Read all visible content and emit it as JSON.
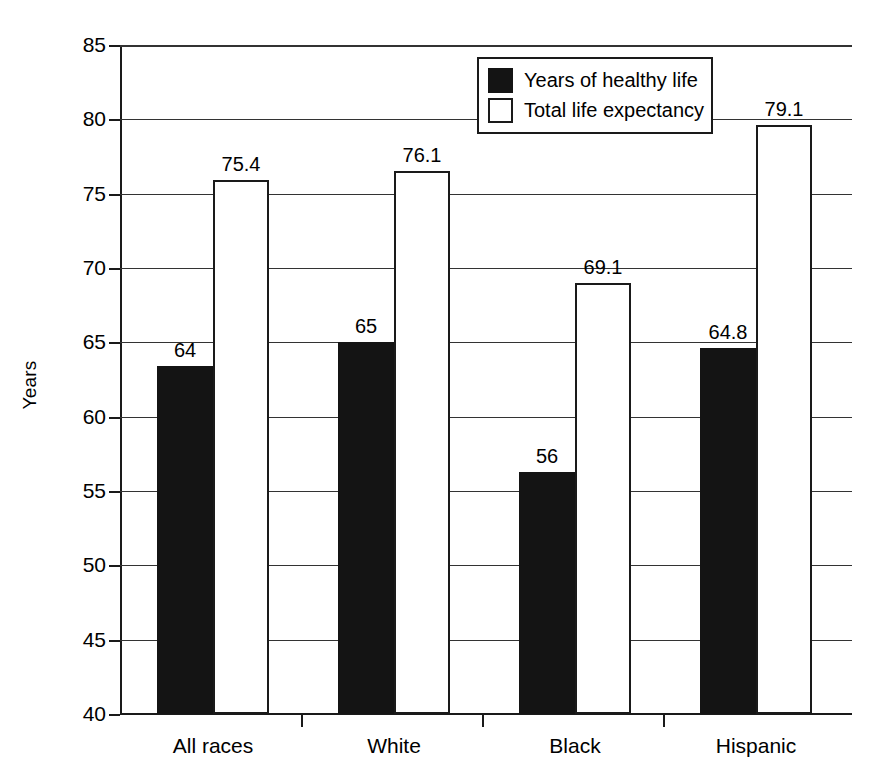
{
  "chart_data": {
    "type": "bar",
    "title": "",
    "subtitle": "",
    "xlabel": "",
    "ylabel": "Years",
    "ylim": [
      40,
      85
    ],
    "yticks": [
      40,
      45,
      50,
      55,
      60,
      65,
      70,
      75,
      80,
      85
    ],
    "grid": true,
    "legend_position": "top-center",
    "categories": [
      "All races",
      "White",
      "Black",
      "Hispanic"
    ],
    "series": [
      {
        "name": "Years of healthy life",
        "color": "#141414",
        "values": [
          63.4,
          65.0,
          56.3,
          64.6
        ],
        "labels": [
          "64",
          "65",
          "56",
          "64.8"
        ]
      },
      {
        "name": "Total life expectancy",
        "color": "#ffffff",
        "values": [
          75.9,
          76.5,
          69.0,
          79.6
        ],
        "labels": [
          "75.4",
          "76.1",
          "69.1",
          "79.1"
        ]
      }
    ]
  },
  "legend": {
    "items": [
      {
        "label": "Years of healthy life",
        "swatch": "dark"
      },
      {
        "label": "Total life expectancy",
        "swatch": "light"
      }
    ]
  },
  "axes": {
    "y": {
      "label": "Years",
      "ticks": [
        "85",
        "80",
        "75",
        "70",
        "65",
        "60",
        "55",
        "50",
        "45",
        "40"
      ]
    },
    "x": {
      "ticks": [
        "All races",
        "White",
        "Black",
        "Hispanic"
      ]
    }
  },
  "colors": {
    "dark_bar": "#141414",
    "light_bar": "#ffffff",
    "line": "#1a1a1a",
    "background": "#ffffff"
  }
}
